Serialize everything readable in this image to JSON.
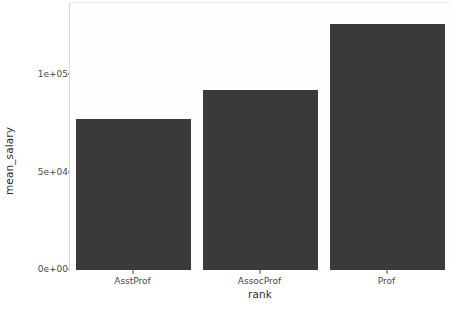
{
  "chart_data": {
    "type": "bar",
    "title": "",
    "subtitle": "",
    "xlabel": "rank",
    "ylabel": "mean_salary",
    "categories": [
      "AsstProf",
      "AssocProf",
      "Prof"
    ],
    "values": [
      77700,
      92400,
      126400
    ],
    "series": [
      {
        "name": "mean_salary",
        "values": [
          77700,
          92400,
          126400
        ]
      }
    ],
    "ylim": [
      0,
      137000
    ],
    "ytick_values": [
      0,
      50000,
      100000
    ],
    "ytick_labels": [
      "0e+00",
      "5e+04",
      "1e+05"
    ],
    "xtick_labels": [
      "AsstProf",
      "AssocProf",
      "Prof"
    ],
    "grid": false,
    "legend": false,
    "legend_position": "none",
    "bar_color": "#3a3a3a",
    "panel_background": "#fefefe",
    "axis_text_color": "#4a4a4a",
    "axis_title_color": "#2b2b2b"
  },
  "axes": {
    "y_title": "mean_salary",
    "x_title": "rank",
    "y_ticks": [
      {
        "label": "0e+00",
        "value": 0
      },
      {
        "label": "5e+04",
        "value": 50000
      },
      {
        "label": "1e+05",
        "value": 100000
      }
    ],
    "x_ticks": [
      {
        "label": "AsstProf",
        "value": 77700
      },
      {
        "label": "AssocProf",
        "value": 92400
      },
      {
        "label": "Prof",
        "value": 126400
      }
    ]
  }
}
